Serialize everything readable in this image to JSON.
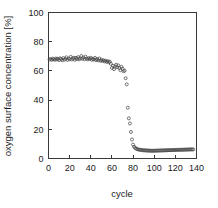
{
  "chart_data": {
    "type": "scatter",
    "title": "",
    "subtitle": "",
    "xlabel": "cycle",
    "ylabel": "oxygen surface concentration [%]",
    "xlim": [
      0,
      140
    ],
    "ylim": [
      0,
      100
    ],
    "xticks": [
      0,
      20,
      40,
      60,
      80,
      100,
      120,
      140
    ],
    "yticks": [
      0,
      20,
      40,
      60,
      80,
      100
    ],
    "grid": false,
    "legend": null,
    "legend_position": "none",
    "marker_style": "open-circle",
    "marker_color": "#4a4a4a",
    "frame": "box",
    "annotations": [],
    "series": [
      {
        "name": "oxygen surface concentration",
        "x": [
          1,
          2,
          3,
          4,
          5,
          6,
          7,
          8,
          9,
          10,
          11,
          12,
          13,
          14,
          15,
          16,
          17,
          18,
          19,
          20,
          21,
          22,
          23,
          24,
          25,
          26,
          27,
          28,
          29,
          30,
          31,
          32,
          33,
          34,
          35,
          36,
          37,
          38,
          39,
          40,
          41,
          42,
          43,
          44,
          45,
          46,
          47,
          48,
          49,
          50,
          51,
          52,
          53,
          54,
          55,
          56,
          57,
          58,
          59,
          60,
          61,
          62,
          63,
          64,
          65,
          66,
          67,
          68,
          69,
          70,
          71,
          72,
          73,
          74,
          75,
          76,
          77,
          78,
          79,
          80,
          81,
          82,
          83,
          84,
          85,
          86,
          87,
          88,
          89,
          90,
          91,
          92,
          93,
          94,
          95,
          96,
          97,
          98,
          99,
          100,
          101,
          102,
          103,
          104,
          105,
          106,
          107,
          108,
          109,
          110,
          111,
          112,
          113,
          114,
          115,
          116,
          117,
          118,
          119,
          120,
          121,
          122,
          123,
          124,
          125,
          126,
          127,
          128,
          129,
          130,
          131,
          132,
          133,
          134,
          135,
          136,
          137
        ],
        "y": [
          67.8,
          68.2,
          67.5,
          68.4,
          68.0,
          67.6,
          68.5,
          67.9,
          68.3,
          67.4,
          68.6,
          68.1,
          67.3,
          68.8,
          67.7,
          68.2,
          69.3,
          67.5,
          68.4,
          68.0,
          69.6,
          67.8,
          68.5,
          69.0,
          67.6,
          68.9,
          68.2,
          69.4,
          67.9,
          68.6,
          70.2,
          68.3,
          69.1,
          68.0,
          69.8,
          68.4,
          67.9,
          68.7,
          68.2,
          69.0,
          67.6,
          68.3,
          67.8,
          68.9,
          67.4,
          68.1,
          67.2,
          68.5,
          67.0,
          67.7,
          66.8,
          67.3,
          66.5,
          67.0,
          66.2,
          66.7,
          65.9,
          66.3,
          64.8,
          62.0,
          63.5,
          61.2,
          63.0,
          64.2,
          62.5,
          63.8,
          62.0,
          60.5,
          62.8,
          61.5,
          59.8,
          60.2,
          55.0,
          50.8,
          34.8,
          27.5,
          24.0,
          18.2,
          13.0,
          9.5,
          8.0,
          7.2,
          6.8,
          6.4,
          6.2,
          6.0,
          5.9,
          5.8,
          5.7,
          5.6,
          5.6,
          5.5,
          5.5,
          5.4,
          5.4,
          5.4,
          5.3,
          5.3,
          5.3,
          5.3,
          5.4,
          5.4,
          5.4,
          5.4,
          5.5,
          5.5,
          5.5,
          5.5,
          5.6,
          5.6,
          5.6,
          5.6,
          5.7,
          5.7,
          5.7,
          5.7,
          5.8,
          5.8,
          5.8,
          5.8,
          5.9,
          5.9,
          5.9,
          5.9,
          6.0,
          6.0,
          6.0,
          6.0,
          6.1,
          6.1,
          6.1,
          6.1,
          6.2,
          6.2,
          6.2,
          6.2,
          6.2
        ]
      }
    ]
  }
}
